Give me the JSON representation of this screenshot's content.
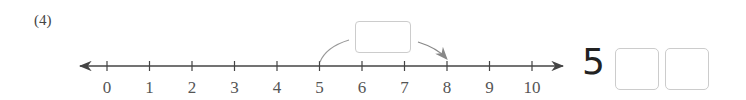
{
  "problem": {
    "label": "(4)"
  },
  "number_line": {
    "min": 0,
    "max": 10,
    "ticks": [
      "0",
      "1",
      "2",
      "3",
      "4",
      "5",
      "6",
      "7",
      "8",
      "9",
      "10"
    ],
    "jump": {
      "from": 5,
      "to": 8,
      "box_value": ""
    }
  },
  "answer": {
    "prefix": "5",
    "boxes": [
      "",
      ""
    ]
  }
}
